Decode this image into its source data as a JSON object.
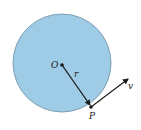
{
  "diagram": {
    "type": "circular-motion",
    "circle": {
      "cx": 62,
      "cy": 63,
      "r": 49,
      "fill": "#9ecbe6",
      "stroke": "#7e9fb3"
    },
    "points": {
      "center": {
        "label": "O",
        "x": 62,
        "y": 65
      },
      "surface": {
        "label": "P",
        "x": 91,
        "y": 107
      }
    },
    "radius_vector": {
      "label": "r",
      "from": "O",
      "to": "P"
    },
    "velocity_vector": {
      "label": "v",
      "from": "P",
      "tip_x": 129,
      "tip_y": 78
    },
    "colors": {
      "ink": "#1a1a1a",
      "background": "#ffffff"
    }
  }
}
